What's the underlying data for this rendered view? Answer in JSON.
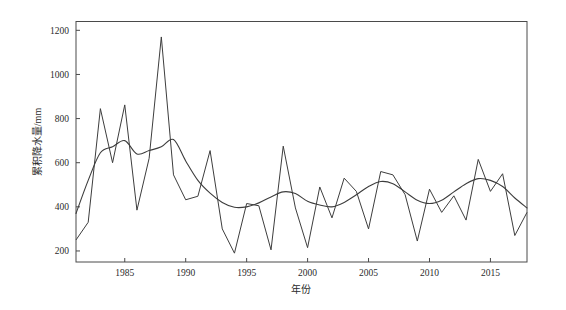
{
  "figure": {
    "background_color": "#ffffff",
    "line_color": "#3d3d3d",
    "axis_color": "#4a4a4a"
  },
  "chart_data": {
    "type": "line",
    "title": "",
    "xlabel": "年份",
    "ylabel": "累积降水量/mm",
    "xlim": [
      1981,
      2018
    ],
    "ylim": [
      150,
      1240
    ],
    "grid": false,
    "legend": "none",
    "x_ticks": [
      1985,
      1990,
      1995,
      2000,
      2005,
      2010,
      2015
    ],
    "y_ticks": [
      200,
      400,
      600,
      800,
      1000,
      1200
    ],
    "x": [
      1981,
      1982,
      1983,
      1984,
      1985,
      1986,
      1987,
      1988,
      1989,
      1990,
      1991,
      1992,
      1993,
      1994,
      1995,
      1996,
      1997,
      1998,
      1999,
      2000,
      2001,
      2002,
      2003,
      2004,
      2005,
      2006,
      2007,
      2008,
      2009,
      2010,
      2011,
      2012,
      2013,
      2014,
      2015,
      2016,
      2017,
      2018
    ],
    "series": [
      {
        "name": "累积降水量",
        "style": "annual",
        "values": [
          250,
          330,
          845,
          600,
          862,
          385,
          620,
          1170,
          545,
          432,
          448,
          655,
          300,
          190,
          415,
          405,
          205,
          675,
          395,
          215,
          490,
          350,
          530,
          470,
          300,
          560,
          545,
          455,
          245,
          480,
          375,
          450,
          340,
          615,
          470,
          550,
          270,
          375
        ]
      },
      {
        "name": "滑动平均",
        "style": "smoothed",
        "values": [
          370,
          520,
          645,
          672,
          700,
          640,
          655,
          672,
          705,
          608,
          520,
          462,
          420,
          398,
          400,
          418,
          445,
          468,
          460,
          425,
          408,
          400,
          420,
          455,
          492,
          515,
          505,
          468,
          430,
          415,
          430,
          468,
          505,
          528,
          520,
          492,
          440,
          395
        ]
      }
    ]
  }
}
